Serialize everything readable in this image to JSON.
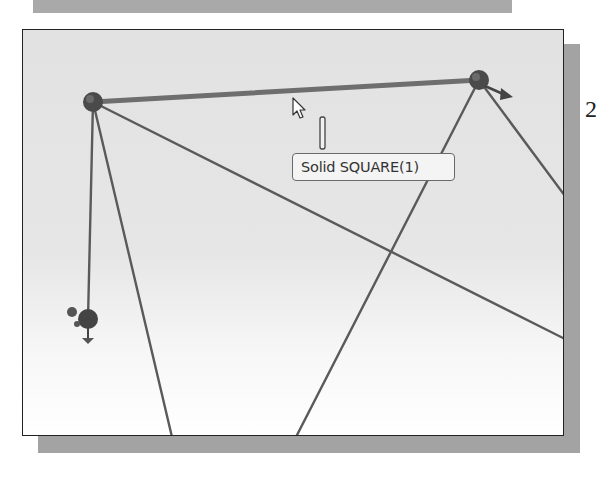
{
  "figure": {
    "side_label": "2"
  },
  "viewport": {
    "background_gradient": [
      "#e2e2e2",
      "#ffffff"
    ],
    "tooltip": {
      "text": "Solid SQUARE(1)"
    },
    "sketch": {
      "line_color": "#555555",
      "point_color": "#444444",
      "points": [
        {
          "id": "p1",
          "x": 70,
          "y": 72
        },
        {
          "id": "p2",
          "x": 456,
          "y": 50
        },
        {
          "id": "p3",
          "x": 65,
          "y": 289
        }
      ],
      "lines": [
        {
          "from": "p1",
          "to": "p2",
          "style": "highlighted"
        },
        {
          "from": "p1",
          "to": "p3",
          "style": "normal"
        },
        {
          "from": "p1",
          "to_edge": [
            149,
            407
          ],
          "style": "normal"
        },
        {
          "from": "p1",
          "to_edge": [
            542,
            309
          ],
          "style": "normal"
        },
        {
          "from": "p2",
          "to_edge": [
            273,
            407
          ],
          "style": "normal"
        },
        {
          "from": "p2",
          "to_edge": [
            542,
            166
          ],
          "style": "normal"
        }
      ]
    },
    "cursor": {
      "type": "arrow-with-line-tool",
      "x": 270,
      "y": 68
    }
  }
}
